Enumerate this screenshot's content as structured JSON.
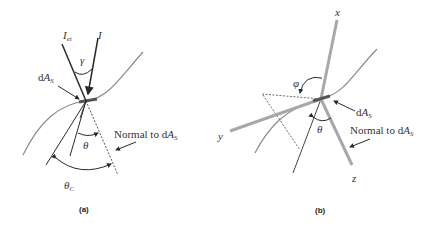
{
  "panels": [
    {
      "id": "a",
      "caption": "(a)",
      "labels": {
        "I_ei_main": "I",
        "I_ei_sub": "ei",
        "I": "I",
        "gamma": "γ",
        "dAs_d": "d",
        "dAs_A": "A",
        "dAs_sub": "S",
        "theta": "θ",
        "theta_c_main": "θ",
        "theta_c_sub": "C",
        "normal_text": "Normal to d",
        "normal_A": "A",
        "normal_sub": "S"
      }
    },
    {
      "id": "b",
      "caption": "(b)",
      "labels": {
        "x": "x",
        "y": "y",
        "z": "z",
        "phi": "φ",
        "theta": "θ",
        "dAs_d": "d",
        "dAs_A": "A",
        "dAs_sub": "S",
        "normal_text": "Normal to d",
        "normal_A": "A",
        "normal_sub": "S"
      }
    }
  ],
  "colors": {
    "line_dark": "#2a2a2a",
    "line_gray": "#8a8a8a",
    "axis_gray": "#a8a8a8",
    "surface_patch": "#555555"
  }
}
